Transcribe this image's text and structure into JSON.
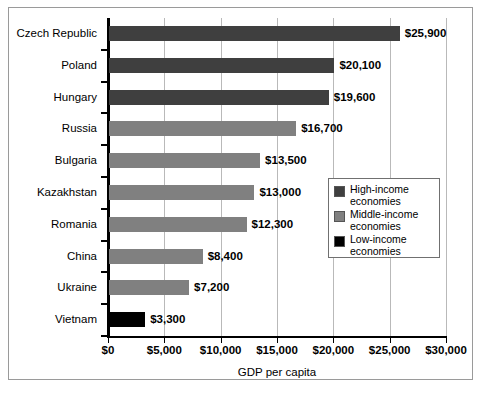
{
  "chart_data": {
    "type": "bar",
    "orientation": "horizontal",
    "title": "",
    "xlabel": "GDP per capita",
    "ylabel": "",
    "xlim": [
      0,
      30000
    ],
    "xticks": [
      0,
      5000,
      10000,
      15000,
      20000,
      25000,
      30000
    ],
    "xtick_labels": [
      "$0",
      "$5,000",
      "$10,000",
      "$15,000",
      "$20,000",
      "$25,000",
      "$30,000"
    ],
    "grid": "vertical",
    "legend_position": "center-right",
    "categories": [
      "Czech Republic",
      "Poland",
      "Hungary",
      "Russia",
      "Bulgaria",
      "Kazakhstan",
      "Romania",
      "China",
      "Ukraine",
      "Vietnam"
    ],
    "values": [
      25900,
      20100,
      19600,
      16700,
      13500,
      13000,
      12300,
      8400,
      7200,
      3300
    ],
    "value_labels": [
      "$25,900",
      "$20,100",
      "$19,600",
      "$16,700",
      "$13,500",
      "$13,000",
      "$12,300",
      "$8,400",
      "$7,200",
      "$3,300"
    ],
    "groups": [
      "high",
      "high",
      "high",
      "middle",
      "middle",
      "middle",
      "middle",
      "middle",
      "middle",
      "low"
    ],
    "bars": [
      {
        "category": "Czech Republic",
        "value": 25900,
        "label": "$25,900",
        "group": "high"
      },
      {
        "category": "Poland",
        "value": 20100,
        "label": "$20,100",
        "group": "high"
      },
      {
        "category": "Hungary",
        "value": 19600,
        "label": "$19,600",
        "group": "high"
      },
      {
        "category": "Russia",
        "value": 16700,
        "label": "$16,700",
        "group": "middle"
      },
      {
        "category": "Bulgaria",
        "value": 13500,
        "label": "$13,500",
        "group": "middle"
      },
      {
        "category": "Kazakhstan",
        "value": 13000,
        "label": "$13,000",
        "group": "middle"
      },
      {
        "category": "Romania",
        "value": 12300,
        "label": "$12,300",
        "group": "middle"
      },
      {
        "category": "China",
        "value": 8400,
        "label": "$8,400",
        "group": "middle"
      },
      {
        "category": "Ukraine",
        "value": 7200,
        "label": "$7,200",
        "group": "middle"
      },
      {
        "category": "Vietnam",
        "value": 3300,
        "label": "$3,300",
        "group": "low"
      }
    ],
    "legend": [
      {
        "key": "high",
        "label": "High-income\neconomies",
        "color": "#3f3f3f"
      },
      {
        "key": "middle",
        "label": "Middle-income\neconomies",
        "color": "#808080"
      },
      {
        "key": "low",
        "label": "Low-income\neconomies",
        "color": "#000000"
      }
    ],
    "colors": {
      "high": "#3f3f3f",
      "middle": "#808080",
      "low": "#000000",
      "gridline": "#b9b9b9",
      "axis": "#000000",
      "frame": "#9a9a9a",
      "background": "#ffffff"
    }
  }
}
